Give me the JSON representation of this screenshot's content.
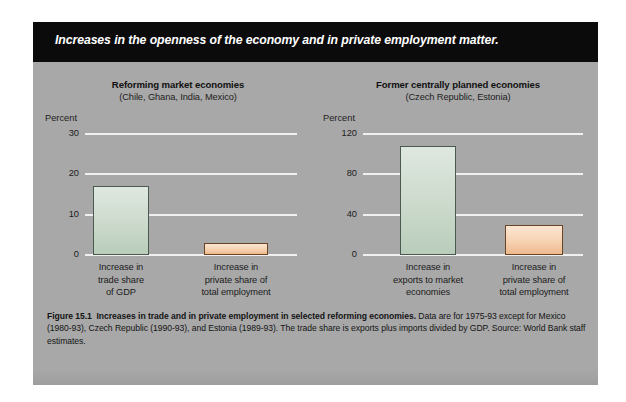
{
  "banner": {
    "text": "Increases in the openness of the economy and in private employment matter."
  },
  "caption": {
    "figure_label": "Figure 15.1",
    "headline": "Increases in trade and in private employment in selected reforming economies.",
    "body": "Data are for 1975-93 except for Mexico (1980-93), Czech Republic (1990-93), and Estonia (1989-93). The trade share is exports plus imports divided by GDP. Source: World Bank staff estimates."
  },
  "colors": {
    "panel_background": "#a8a8a8",
    "banner_background": "#0b0b0b",
    "gridline": "#f0f0f0",
    "bar_green_fill": "#cfdccf",
    "bar_green_border": "#4a5a50",
    "bar_orange_fill": "#f6d2b2",
    "bar_orange_border": "#6b4426"
  },
  "chart_data": [
    {
      "id": "reforming-market-economies",
      "type": "bar",
      "title": "Reforming market economies",
      "subtitle": "(Chile, Ghana, India, Mexico)",
      "ylabel": "Percent",
      "xlabel": "",
      "categories": [
        "Increase in trade share of GDP",
        "Increase in private share of total employment"
      ],
      "category_lines": [
        [
          "Increase in",
          "trade share",
          "of GDP"
        ],
        [
          "Increase in",
          "private share of",
          "total employment"
        ]
      ],
      "values": [
        17,
        3
      ],
      "bar_colors": [
        "green",
        "orange"
      ],
      "ylim": [
        0,
        30
      ],
      "yticks": [
        0,
        10,
        20,
        30
      ],
      "ytick_labels": [
        "0",
        "10",
        "20",
        "30"
      ],
      "grid": true,
      "legend": "none"
    },
    {
      "id": "former-centrally-planned-economies",
      "type": "bar",
      "title": "Former centrally planned economies",
      "subtitle": "(Czech Republic, Estonia)",
      "ylabel": "Percent",
      "xlabel": "",
      "categories": [
        "Increase in exports to market economies",
        "Increase in private share of total employment"
      ],
      "category_lines": [
        [
          "Increase in",
          "exports to market",
          "economies"
        ],
        [
          "Increase in",
          "private share of",
          "total employment"
        ]
      ],
      "values": [
        108,
        30
      ],
      "bar_colors": [
        "green",
        "orange"
      ],
      "ylim": [
        0,
        120
      ],
      "yticks": [
        0,
        40,
        80,
        120
      ],
      "ytick_labels": [
        "0",
        "40",
        "80",
        "120"
      ],
      "grid": true,
      "legend": "none"
    }
  ]
}
